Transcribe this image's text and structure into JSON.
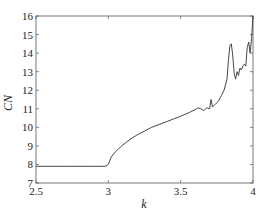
{
  "chart_data": {
    "type": "line",
    "title": "",
    "xlabel": "k",
    "ylabel": "CN",
    "xlim": [
      2.5,
      4.0
    ],
    "ylim": [
      7,
      16
    ],
    "grid": false,
    "legend": null,
    "x_ticks": [
      2.5,
      3,
      3.5,
      4
    ],
    "x_tick_labels": [
      "2.5",
      "3",
      "3.5",
      "4"
    ],
    "y_ticks": [
      7,
      8,
      9,
      10,
      11,
      12,
      13,
      14,
      15,
      16
    ],
    "y_tick_labels": [
      "7",
      "8",
      "9",
      "10",
      "11",
      "12",
      "13",
      "14",
      "15",
      "16"
    ],
    "series": [
      {
        "name": "CN",
        "color": "#333333",
        "x": [
          2.5,
          2.7,
          2.9,
          2.98,
          3.0,
          3.02,
          3.05,
          3.1,
          3.15,
          3.2,
          3.25,
          3.3,
          3.35,
          3.4,
          3.45,
          3.5,
          3.53,
          3.56,
          3.6,
          3.62,
          3.64,
          3.66,
          3.68,
          3.7,
          3.71,
          3.72,
          3.74,
          3.76,
          3.78,
          3.8,
          3.82,
          3.83,
          3.84,
          3.85,
          3.86,
          3.87,
          3.88,
          3.89,
          3.9,
          3.91,
          3.92,
          3.93,
          3.94,
          3.95,
          3.96,
          3.97,
          3.98,
          3.99,
          4.0
        ],
        "y": [
          7.9,
          7.9,
          7.9,
          7.9,
          8.0,
          8.4,
          8.7,
          9.05,
          9.35,
          9.6,
          9.8,
          10.0,
          10.15,
          10.3,
          10.45,
          10.6,
          10.7,
          10.8,
          10.95,
          11.05,
          11.0,
          10.9,
          11.05,
          11.0,
          11.5,
          11.1,
          11.25,
          11.4,
          11.7,
          12.0,
          12.6,
          13.6,
          14.4,
          14.5,
          13.9,
          12.9,
          12.6,
          13.0,
          12.8,
          13.2,
          13.1,
          13.3,
          13.4,
          13.3,
          14.3,
          14.6,
          14.0,
          14.8,
          16.0
        ]
      }
    ]
  }
}
